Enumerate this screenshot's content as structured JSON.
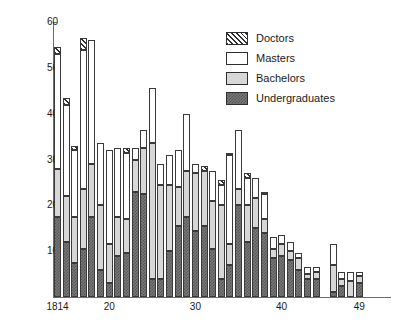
{
  "chart_data": {
    "type": "bar",
    "title": "",
    "subtitle": "",
    "xlabel": "",
    "ylabel": "",
    "stacked": true,
    "grid": false,
    "legend_position": "top-right",
    "ylim": [
      0,
      60
    ],
    "xlim": [
      1814,
      1849
    ],
    "ytick_labels": [
      "60",
      "50",
      "40",
      "30",
      "20",
      "10"
    ],
    "ytick_values": [
      60,
      50,
      40,
      30,
      20,
      10
    ],
    "xtick_labels": [
      "1814",
      "20",
      "30",
      "40",
      "49"
    ],
    "xtick_values": [
      1814,
      1820,
      1830,
      1840,
      1849
    ],
    "categories": [
      1814,
      1815,
      1816,
      1817,
      1818,
      1819,
      1820,
      1821,
      1822,
      1823,
      1824,
      1825,
      1826,
      1827,
      1828,
      1829,
      1830,
      1831,
      1832,
      1833,
      1834,
      1835,
      1836,
      1837,
      1838,
      1839,
      1840,
      1841,
      1842,
      1843,
      1844,
      1845,
      1846,
      1847,
      1848,
      1849
    ],
    "series": [
      {
        "name": "Undergraduates",
        "color": "#787878",
        "pattern": "dense-checker",
        "values": [
          17.5,
          12,
          7.5,
          10.5,
          17.5,
          6,
          3,
          9,
          9.5,
          23,
          22.5,
          4,
          4,
          10,
          15.5,
          17.5,
          14.5,
          15.5,
          10.5,
          4,
          7,
          20,
          12,
          15,
          14,
          8.5,
          9,
          8,
          6,
          4,
          4,
          0,
          1,
          2.5,
          0,
          3
        ]
      },
      {
        "name": "Bachelors",
        "color": "#d7d7d7",
        "pattern": "solid-light",
        "values": [
          10.5,
          10,
          10,
          13,
          11.5,
          14,
          8.5,
          8.5,
          7.5,
          7,
          10,
          29.5,
          20.5,
          14.5,
          8.5,
          10,
          12.5,
          12,
          10.5,
          16,
          4.5,
          3.5,
          8,
          6.5,
          3,
          2,
          2.5,
          2,
          2.5,
          1,
          1.5,
          0,
          6,
          1.5,
          3.5,
          1.5
        ]
      },
      {
        "name": "Masters",
        "color": "#ffffff",
        "pattern": "dots",
        "values": [
          25,
          20,
          14.5,
          30.5,
          27,
          13.5,
          20.5,
          15,
          14.5,
          2.5,
          4,
          12,
          4.5,
          6.5,
          8,
          12.5,
          2,
          0,
          6.5,
          4.5,
          19.5,
          13,
          6,
          4.5,
          5.5,
          2.5,
          2,
          2,
          1,
          1.5,
          1,
          0,
          4.5,
          1.5,
          2,
          1
        ]
      },
      {
        "name": "Doctors",
        "color": "#e8e8e8",
        "pattern": "diagonal-hatch",
        "values": [
          1.5,
          1.5,
          1,
          2.5,
          0,
          0,
          0,
          0,
          1,
          0,
          0,
          0,
          0,
          0,
          0,
          0,
          0,
          1,
          0,
          1,
          0.5,
          0,
          1,
          0,
          0.5,
          0,
          0,
          0,
          0,
          0,
          0,
          0,
          0,
          0,
          0,
          0
        ]
      }
    ]
  },
  "legend": {
    "items": [
      {
        "label": "Doctors",
        "swatch": "diagonal-hatch"
      },
      {
        "label": "Masters",
        "swatch": "dots"
      },
      {
        "label": "Bachelors",
        "swatch": "solid-light"
      },
      {
        "label": "Undergraduates",
        "swatch": "dense-checker"
      }
    ]
  },
  "colors": {
    "axis": "#6d6d6d",
    "text": "#1a1a1a",
    "background": "#ffffff",
    "undergraduates": "#787878",
    "bachelors": "#d7d7d7",
    "masters": "#ffffff",
    "doctors": "#e8e8e8"
  }
}
